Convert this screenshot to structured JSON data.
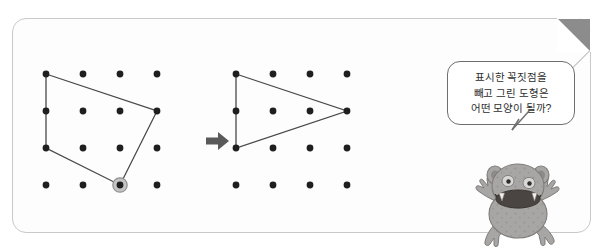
{
  "page": {
    "background_color": "#ffffff",
    "card": {
      "background_color": "#fdfdfd",
      "border_color": "#c9c9c9",
      "fold_color": "#8c8c8c"
    }
  },
  "figures": {
    "dot_color": "#1f1f1f",
    "line_color": "#4a4a4a",
    "marker_ring_color": "#9a9a9a",
    "grid": {
      "rows": 4,
      "cols": 4,
      "spacing_px": 37
    },
    "left": {
      "name": "quadrilateral-dot-grid",
      "shape": "quadrilateral",
      "vertices": [
        {
          "row": 1,
          "col": 1,
          "marked": false
        },
        {
          "row": 2,
          "col": 4,
          "marked": false
        },
        {
          "row": 4,
          "col": 3,
          "marked": true
        },
        {
          "row": 3,
          "col": 1,
          "marked": false
        }
      ],
      "marked_vertex": {
        "row": 4,
        "col": 3
      }
    },
    "right": {
      "name": "triangle-dot-grid",
      "shape": "triangle",
      "vertices": [
        {
          "row": 1,
          "col": 1,
          "marked": false
        },
        {
          "row": 2,
          "col": 4,
          "marked": false
        },
        {
          "row": 3,
          "col": 1,
          "marked": false
        }
      ],
      "marked_vertex": null
    }
  },
  "arrow": {
    "direction": "right",
    "color": "#5a5a5a"
  },
  "speech_bubble": {
    "lines": [
      "표시한 꼭짓점을",
      "빼고 그린 도형은",
      "어떤 모양이 될까?"
    ],
    "border_color": "#6e6e6e",
    "text_color": "#2e2e2e"
  },
  "character": {
    "name": "gray-monster-toad",
    "body_color": "#a8a6a4",
    "mouth_color": "#4a4442"
  }
}
